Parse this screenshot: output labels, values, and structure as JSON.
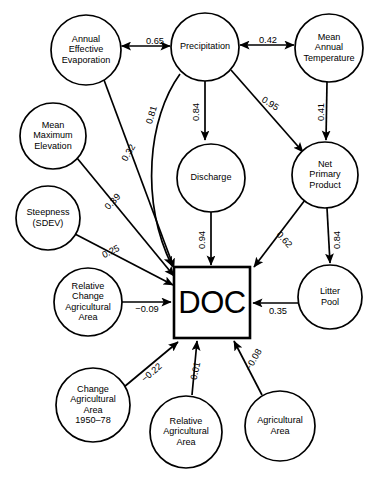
{
  "figure": {
    "type": "path-diagram",
    "target_node": "DOC"
  },
  "nodes": [
    {
      "id": "aee",
      "label_lines": [
        "Annual",
        "Effective",
        "Evaporation"
      ],
      "shape": "ellipse",
      "cx": 86,
      "cy": 50,
      "rx": 35,
      "ry": 35
    },
    {
      "id": "precip",
      "label_lines": [
        "Precipitation"
      ],
      "shape": "ellipse",
      "cx": 205,
      "cy": 47,
      "rx": 34,
      "ry": 34
    },
    {
      "id": "mat",
      "label_lines": [
        "Mean",
        "Annual",
        "Temperature"
      ],
      "shape": "ellipse",
      "cx": 329,
      "cy": 48,
      "rx": 34,
      "ry": 34
    },
    {
      "id": "mme",
      "label_lines": [
        "Mean",
        "Maximum",
        "Elevation"
      ],
      "shape": "ellipse",
      "cx": 53,
      "cy": 136,
      "rx": 33,
      "ry": 33
    },
    {
      "id": "discharge",
      "label_lines": [
        "Discharge"
      ],
      "shape": "ellipse",
      "cx": 211,
      "cy": 178,
      "rx": 34,
      "ry": 34
    },
    {
      "id": "npp",
      "label_lines": [
        "Net",
        "Primary",
        "Product"
      ],
      "shape": "ellipse",
      "cx": 325,
      "cy": 175,
      "rx": 33,
      "ry": 33
    },
    {
      "id": "steep",
      "label_lines": [
        "Steepness",
        "(SDEV)"
      ],
      "shape": "ellipse",
      "cx": 48,
      "cy": 218,
      "rx": 32,
      "ry": 32
    },
    {
      "id": "rcaa",
      "label_lines": [
        "Relative",
        "Change",
        "Agricultural",
        "Area"
      ],
      "shape": "ellipse",
      "cx": 88,
      "cy": 302,
      "rx": 34,
      "ry": 34
    },
    {
      "id": "doc",
      "label_lines": [
        "DOC"
      ],
      "shape": "rect",
      "x": 174,
      "y": 267,
      "w": 76,
      "h": 71
    },
    {
      "id": "litter",
      "label_lines": [
        "Litter",
        "Pool"
      ],
      "shape": "ellipse",
      "cx": 330,
      "cy": 297,
      "rx": 32,
      "ry": 32
    },
    {
      "id": "caa",
      "label_lines": [
        "Change",
        "Agricultural",
        "Area",
        "1950–78"
      ],
      "shape": "ellipse",
      "cx": 93,
      "cy": 405,
      "rx": 37,
      "ry": 37
    },
    {
      "id": "raa",
      "label_lines": [
        "Relative",
        "Agricultural",
        "Area"
      ],
      "shape": "ellipse",
      "cx": 186,
      "cy": 432,
      "rx": 36,
      "ry": 36
    },
    {
      "id": "aa",
      "label_lines": [
        "Agricultural",
        "Area"
      ],
      "shape": "ellipse",
      "cx": 280,
      "cy": 426,
      "rx": 35,
      "ry": 35
    }
  ],
  "edges": [
    {
      "id": "e1",
      "from": "aee",
      "to": "precip",
      "value": "0.65",
      "arrow": "both",
      "label_x": 155,
      "label_y": 42,
      "label_rot": 0
    },
    {
      "id": "e2",
      "from": "precip",
      "to": "mat",
      "value": "0.42",
      "arrow": "both",
      "label_x": 268,
      "label_y": 41,
      "label_rot": 0
    },
    {
      "id": "e3",
      "from": "precip",
      "to": "discharge",
      "value": "0.84",
      "arrow": "to",
      "label_x": 197,
      "label_y": 112,
      "label_rot": -90
    },
    {
      "id": "e4",
      "from": "precip",
      "to": "npp",
      "value": "0.95",
      "arrow": "to",
      "label_x": 270,
      "label_y": 104,
      "label_rot": 32
    },
    {
      "id": "e5",
      "from": "mat",
      "to": "npp",
      "value": "0.41",
      "arrow": "to",
      "label_x": 322,
      "label_y": 112,
      "label_rot": -90
    },
    {
      "id": "e6",
      "from": "precip",
      "to": "doc",
      "value": "0.81",
      "arrow": "to",
      "label_x": 152,
      "label_y": 115,
      "label_rot": -73
    },
    {
      "id": "e7",
      "from": "aee",
      "to": "doc",
      "value": "0.32",
      "arrow": "to",
      "label_x": 129,
      "label_y": 153,
      "label_rot": -60
    },
    {
      "id": "e8",
      "from": "mme",
      "to": "doc",
      "value": "0.39",
      "arrow": "to",
      "label_x": 113,
      "label_y": 202,
      "label_rot": -47
    },
    {
      "id": "e9",
      "from": "steep",
      "to": "doc",
      "value": "0.25",
      "arrow": "to",
      "label_x": 111,
      "label_y": 252,
      "label_rot": -26
    },
    {
      "id": "e10",
      "from": "discharge",
      "to": "doc",
      "value": "0.94",
      "arrow": "to",
      "label_x": 203,
      "label_y": 240,
      "label_rot": -90
    },
    {
      "id": "e11",
      "from": "npp",
      "to": "doc",
      "value": "0.62",
      "arrow": "to",
      "label_x": 284,
      "label_y": 240,
      "label_rot": 48
    },
    {
      "id": "e12",
      "from": "npp",
      "to": "litter",
      "value": "0.84",
      "arrow": "to",
      "label_x": 338,
      "label_y": 240,
      "label_rot": -90
    },
    {
      "id": "e13",
      "from": "litter",
      "to": "doc",
      "value": "0.35",
      "arrow": "to",
      "label_x": 278,
      "label_y": 312,
      "label_rot": 0
    },
    {
      "id": "e14",
      "from": "rcaa",
      "to": "doc",
      "value": "−0.09",
      "arrow": "to",
      "label_x": 147,
      "label_y": 310,
      "label_rot": 0
    },
    {
      "id": "e15",
      "from": "caa",
      "to": "doc",
      "value": "−0.22",
      "arrow": "to",
      "label_x": 152,
      "label_y": 373,
      "label_rot": -41
    },
    {
      "id": "e16",
      "from": "raa",
      "to": "doc",
      "value": "0.01",
      "arrow": "to",
      "label_x": 196,
      "label_y": 371,
      "label_rot": -78
    },
    {
      "id": "e17",
      "from": "aa",
      "to": "doc",
      "value": "−0.08",
      "arrow": "to",
      "label_x": 254,
      "label_y": 360,
      "label_rot": -60
    }
  ],
  "chart_data": {
    "type": "diagram",
    "path_coefficients": [
      {
        "source": "Annual Effective Evaporation",
        "target": "Precipitation",
        "value": 0.65,
        "bidirectional": true
      },
      {
        "source": "Precipitation",
        "target": "Mean Annual Temperature",
        "value": 0.42,
        "bidirectional": true
      },
      {
        "source": "Precipitation",
        "target": "Discharge",
        "value": 0.84,
        "bidirectional": false
      },
      {
        "source": "Precipitation",
        "target": "Net Primary Product",
        "value": 0.95,
        "bidirectional": false
      },
      {
        "source": "Mean Annual Temperature",
        "target": "Net Primary Product",
        "value": 0.41,
        "bidirectional": false
      },
      {
        "source": "Precipitation",
        "target": "DOC",
        "value": 0.81,
        "bidirectional": false
      },
      {
        "source": "Annual Effective Evaporation",
        "target": "DOC",
        "value": 0.32,
        "bidirectional": false
      },
      {
        "source": "Mean Maximum Elevation",
        "target": "DOC",
        "value": 0.39,
        "bidirectional": false
      },
      {
        "source": "Steepness (SDEV)",
        "target": "DOC",
        "value": 0.25,
        "bidirectional": false
      },
      {
        "source": "Discharge",
        "target": "DOC",
        "value": 0.94,
        "bidirectional": false
      },
      {
        "source": "Net Primary Product",
        "target": "DOC",
        "value": 0.62,
        "bidirectional": false
      },
      {
        "source": "Net Primary Product",
        "target": "Litter Pool",
        "value": 0.84,
        "bidirectional": false
      },
      {
        "source": "Litter Pool",
        "target": "DOC",
        "value": 0.35,
        "bidirectional": false
      },
      {
        "source": "Relative Change Agricultural Area",
        "target": "DOC",
        "value": -0.09,
        "bidirectional": false
      },
      {
        "source": "Change Agricultural Area 1950-78",
        "target": "DOC",
        "value": -0.22,
        "bidirectional": false
      },
      {
        "source": "Relative Agricultural Area",
        "target": "DOC",
        "value": 0.01,
        "bidirectional": false
      },
      {
        "source": "Agricultural Area",
        "target": "DOC",
        "value": -0.08,
        "bidirectional": false
      }
    ]
  },
  "geometry": {
    "edge_paths": {
      "e1": "M 121.5,46 L 170,46",
      "e2": "M 240,45 L 294,45",
      "e3": "M 205,81 L 205,140",
      "e4": "M 231,70 L 303,152",
      "e5": "M 327,82 L 326,140",
      "e6": "M 180,74 C 148,118 140,200 172,266",
      "e7": "M 104,80 L 174,268",
      "e8": "M 77,158 L 174,276",
      "e9": "M 75,234 L 173,285",
      "e10": "M 211,212 L 211,265",
      "e11": "M 305,200 L 254,267",
      "e12": "M 327,208 L 330,263",
      "e13": "M 298,303 L 253,303",
      "e14": "M 122,302 L 171,302",
      "e15": "M 124,387 L 178,342",
      "e16": "M 192,395 L 197,341",
      "e17": "M 262,395 L 234,341"
    }
  }
}
